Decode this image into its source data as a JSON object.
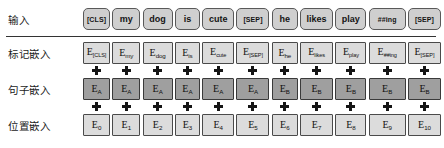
{
  "diagram": {
    "rows": {
      "input": {
        "label": "输入"
      },
      "token_embeddings": {
        "label": "标记嵌入"
      },
      "segment_embeddings": {
        "label": "句子嵌入"
      },
      "position_embeddings": {
        "label": "位置嵌入"
      }
    },
    "plus_symbol": "+",
    "colors": {
      "token_box_fill": "#cfcfcf",
      "embedding_box_fill": "#dcdcdc",
      "segment_box_fill": "#9f9f9f",
      "border": "#5d5d5d",
      "text": "#141414",
      "separator": "#333333"
    }
  },
  "tokens": [
    {
      "input": "[CLS]",
      "token_emb_base": "E",
      "token_emb_sub": "[CLS]",
      "segment_emb_base": "E",
      "segment_emb_sub": "A",
      "position_emb_base": "E",
      "position_emb_sub": "0"
    },
    {
      "input": "my",
      "token_emb_base": "E",
      "token_emb_sub": "my",
      "segment_emb_base": "E",
      "segment_emb_sub": "A",
      "position_emb_base": "E",
      "position_emb_sub": "1"
    },
    {
      "input": "dog",
      "token_emb_base": "E",
      "token_emb_sub": "dog",
      "segment_emb_base": "E",
      "segment_emb_sub": "A",
      "position_emb_base": "E",
      "position_emb_sub": "2"
    },
    {
      "input": "is",
      "token_emb_base": "E",
      "token_emb_sub": "is",
      "segment_emb_base": "E",
      "segment_emb_sub": "A",
      "position_emb_base": "E",
      "position_emb_sub": "3"
    },
    {
      "input": "cute",
      "token_emb_base": "E",
      "token_emb_sub": "cute",
      "segment_emb_base": "E",
      "segment_emb_sub": "A",
      "position_emb_base": "E",
      "position_emb_sub": "4"
    },
    {
      "input": "[SEP]",
      "token_emb_base": "E",
      "token_emb_sub": "[SEP]",
      "segment_emb_base": "E",
      "segment_emb_sub": "A",
      "position_emb_base": "E",
      "position_emb_sub": "5"
    },
    {
      "input": "he",
      "token_emb_base": "E",
      "token_emb_sub": "he",
      "segment_emb_base": "E",
      "segment_emb_sub": "B",
      "position_emb_base": "E",
      "position_emb_sub": "6"
    },
    {
      "input": "likes",
      "token_emb_base": "E",
      "token_emb_sub": "likes",
      "segment_emb_base": "E",
      "segment_emb_sub": "B",
      "position_emb_base": "E",
      "position_emb_sub": "7"
    },
    {
      "input": "play",
      "token_emb_base": "E",
      "token_emb_sub": "play",
      "segment_emb_base": "E",
      "segment_emb_sub": "B",
      "position_emb_base": "E",
      "position_emb_sub": "8"
    },
    {
      "input": "##ing",
      "token_emb_base": "E",
      "token_emb_sub": "##ing",
      "segment_emb_base": "E",
      "segment_emb_sub": "B",
      "position_emb_base": "E",
      "position_emb_sub": "9"
    },
    {
      "input": "[SEP]",
      "token_emb_base": "E",
      "token_emb_sub": "[SEP]",
      "segment_emb_base": "E",
      "segment_emb_sub": "B",
      "position_emb_base": "E",
      "position_emb_sub": "10"
    }
  ]
}
